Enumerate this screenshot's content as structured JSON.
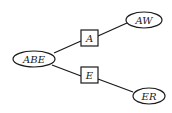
{
  "diagram": {
    "type": "junction-tree",
    "nodes": [
      {
        "id": "ABE",
        "label": "ABE",
        "shape": "ellipse"
      },
      {
        "id": "A",
        "label": "A",
        "shape": "box"
      },
      {
        "id": "AW",
        "label": "AW",
        "shape": "ellipse"
      },
      {
        "id": "E",
        "label": "E",
        "shape": "box"
      },
      {
        "id": "ER",
        "label": "ER",
        "shape": "ellipse"
      }
    ],
    "edges": [
      {
        "from": "ABE",
        "to": "A"
      },
      {
        "from": "A",
        "to": "AW"
      },
      {
        "from": "ABE",
        "to": "E"
      },
      {
        "from": "E",
        "to": "ER"
      }
    ]
  }
}
